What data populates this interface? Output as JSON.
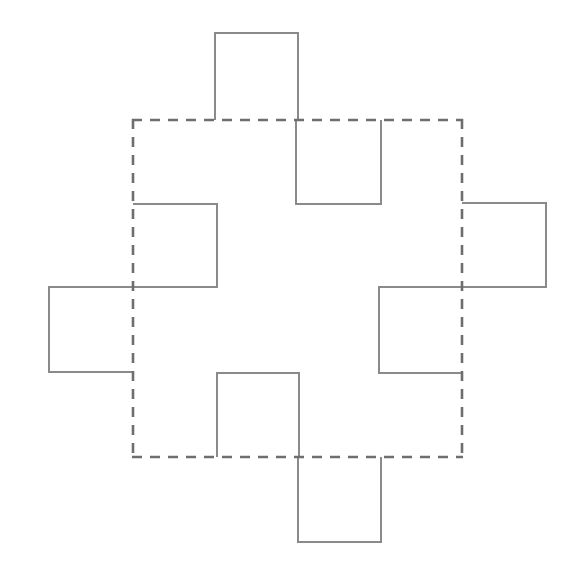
{
  "figure": {
    "canvas": {
      "width": 575,
      "height": 575,
      "background": "#ffffff"
    },
    "styles": {
      "solid_stroke_color": "#8a8a8a",
      "dashed_stroke_color": "#6e6e6e",
      "solid_stroke_width": 2,
      "dashed_stroke_width": 2.6,
      "dash_pattern": "10 8"
    },
    "geometry": {
      "base_square": {
        "left": 133,
        "top": 120,
        "right": 462,
        "bottom": 457,
        "width": 329,
        "height": 337
      },
      "unit": 83
    },
    "solid_outline_path": "M 215 33 L 298 33 L 298 120 L 296 120 L 296 204 L 381 204 L 381 120 L 462 120 L 462 203 L 546 203 L 546 287 L 462 287 L 462 373 L 379 373 L 379 287 L 133 287 L 133 372 L 49 372 L 49 287 L 133 287 L 133 204 L 217 204 L 217 287 L 217 373 L 299 373 L 299 457 L 298 457 L 298 542 L 381 542 L 381 457 L 462 457",
    "dashed_outline_path": "M 133 120 L 462 120 L 462 457 L 133 457 Z",
    "segments": {
      "solid": [
        {
          "name": "top-tab",
          "direction": "outward",
          "side": "top",
          "x1": 215,
          "y1": 33,
          "x2": 298,
          "y2": 120
        },
        {
          "name": "top-center-notch",
          "direction": "inward",
          "side": "top",
          "x1": 296,
          "y1": 120,
          "x2": 381,
          "y2": 204
        },
        {
          "name": "left-upper-notch",
          "direction": "inward",
          "side": "left",
          "x1": 133,
          "y1": 204,
          "x2": 217,
          "y2": 287
        },
        {
          "name": "right-upper-tab",
          "direction": "outward",
          "side": "right",
          "x1": 462,
          "y1": 203,
          "x2": 546,
          "y2": 287
        },
        {
          "name": "left-middle-tab",
          "direction": "outward",
          "side": "left",
          "x1": 49,
          "y1": 287,
          "x2": 133,
          "y2": 372
        },
        {
          "name": "right-lower-notch",
          "direction": "inward",
          "side": "right",
          "x1": 379,
          "y1": 287,
          "x2": 462,
          "y2": 373
        },
        {
          "name": "bottom-center-notch",
          "direction": "inward",
          "side": "bottom",
          "x1": 217,
          "y1": 373,
          "x2": 299,
          "y2": 457
        },
        {
          "name": "bottom-tab",
          "direction": "outward",
          "side": "bottom",
          "x1": 298,
          "y1": 457,
          "x2": 381,
          "y2": 542
        }
      ],
      "dashed": [
        {
          "name": "dashed-top-edge",
          "x1": 133,
          "y1": 120,
          "x2": 462,
          "y2": 120
        },
        {
          "name": "dashed-right-edge",
          "x1": 462,
          "y1": 120,
          "x2": 462,
          "y2": 457
        },
        {
          "name": "dashed-bottom-edge",
          "x1": 133,
          "y1": 457,
          "x2": 462,
          "y2": 457
        },
        {
          "name": "dashed-left-edge",
          "x1": 133,
          "y1": 120,
          "x2": 133,
          "y2": 457
        }
      ]
    }
  }
}
